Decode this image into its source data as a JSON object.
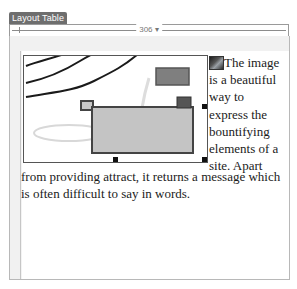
{
  "layout_table": {
    "tab_label": "Layout Table",
    "width_label": "306 ▾"
  },
  "content": {
    "image": {
      "semantic": "drawing-image",
      "description": "line drawing with curves and gray rectangles"
    },
    "inline_icon": "small-image-icon",
    "wrapped_lines": [
      "The image",
      "is a beautiful",
      "way to",
      "express the",
      "bountifying",
      "elements of a",
      "site. Apart"
    ],
    "full_lines": [
      "from providing attract, it returns a message which",
      "is often difficult to say in words."
    ]
  },
  "colors": {
    "tab_bg": "#6e6e6e",
    "border": "#b8b8b8",
    "image_fill": "#c4c4c4",
    "image_stroke": "#444444"
  }
}
